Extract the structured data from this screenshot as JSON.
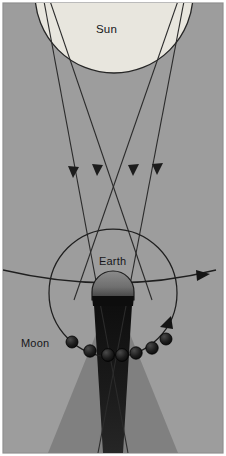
{
  "figure": {
    "type": "astronomy-ray-diagram",
    "width": 226,
    "height": 456,
    "background_color": "#9d9d9d",
    "border_color": "#8a8a8a"
  },
  "labels": {
    "sun": "Sun",
    "earth": "Earth",
    "moon": "Moon"
  },
  "bodies": {
    "sun": {
      "name": "Sun",
      "fill": "#e8e6de",
      "stroke": "#2b2b2b",
      "cx": 114,
      "cy": -6,
      "r": 79
    },
    "earth": {
      "name": "Earth",
      "fill_lit": "#7d7d7d",
      "fill_dark": "#101010",
      "stroke": "#1c1c1c",
      "cx": 113,
      "cy": 292,
      "r": 21
    },
    "moons": [
      {
        "cx": 72,
        "cy": 342,
        "r": 6.0,
        "phase": "outside-shadow"
      },
      {
        "cx": 90,
        "cy": 351,
        "r": 6.2,
        "phase": "entering-penumbra"
      },
      {
        "cx": 108,
        "cy": 355,
        "r": 6.4,
        "phase": "umbra"
      },
      {
        "cx": 122,
        "cy": 355,
        "r": 6.4,
        "phase": "umbra"
      },
      {
        "cx": 136,
        "cy": 353,
        "r": 6.2,
        "phase": "umbra"
      },
      {
        "cx": 152,
        "cy": 348,
        "r": 6.2,
        "phase": "leaving-penumbra"
      },
      {
        "cx": 166,
        "cy": 339,
        "r": 6.0,
        "phase": "outside-shadow"
      }
    ]
  },
  "shadow": {
    "umbra_color": "#141414",
    "penumbra_color": "#7e7e7e",
    "umbra_label": "umbra",
    "penumbra_label": "penumbra"
  },
  "rays": {
    "count": 4,
    "stroke": "#2b2b2b",
    "arrowheads": [
      {
        "x": 73,
        "y": 172
      },
      {
        "x": 97,
        "y": 170
      },
      {
        "x": 133,
        "y": 171
      },
      {
        "x": 157,
        "y": 170
      }
    ],
    "paths": [
      {
        "from_x": 44,
        "from_y": 2,
        "to_x": 126,
        "to_y": 456
      },
      {
        "from_x": 48,
        "from_y": 2,
        "to_x": 150,
        "to_y": 292
      },
      {
        "from_x": 180,
        "from_y": 2,
        "to_x": 76,
        "to_y": 292
      },
      {
        "from_x": 184,
        "from_y": 2,
        "to_x": 100,
        "to_y": 456
      }
    ]
  },
  "orbits": {
    "moon_orbit": {
      "cx": 113,
      "cy": 293,
      "r": 64,
      "stroke": "#1f1f1f",
      "arrow": {
        "x": 166,
        "y": 320,
        "angle": -52
      }
    },
    "ecliptic_line": {
      "stroke": "#1f1f1f",
      "arrow": {
        "x": 205,
        "y": 276
      },
      "left_y": 271,
      "mid_y": 287,
      "right_y": 270
    }
  }
}
